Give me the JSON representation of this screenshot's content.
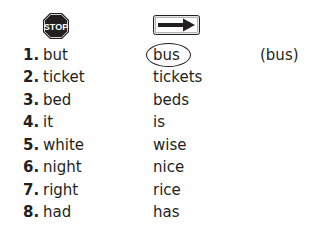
{
  "icons": {
    "stop": {
      "name": "stop-sign-icon",
      "label": "STOP",
      "color": "#231f20"
    },
    "arrow": {
      "name": "right-arrow-sign-icon"
    }
  },
  "example_answer": "(bus)",
  "items": [
    {
      "num": "1.",
      "word": "but",
      "pair": "bus",
      "circled": true
    },
    {
      "num": "2.",
      "word": "ticket",
      "pair": "tickets"
    },
    {
      "num": "3.",
      "word": "bed",
      "pair": "beds"
    },
    {
      "num": "4.",
      "word": "it",
      "pair": "is"
    },
    {
      "num": "5.",
      "word": "white",
      "pair": "wise"
    },
    {
      "num": "6.",
      "word": "night",
      "pair": "nice"
    },
    {
      "num": "7.",
      "word": "right",
      "pair": "rice"
    },
    {
      "num": "8.",
      "word": "had",
      "pair": "has"
    }
  ]
}
